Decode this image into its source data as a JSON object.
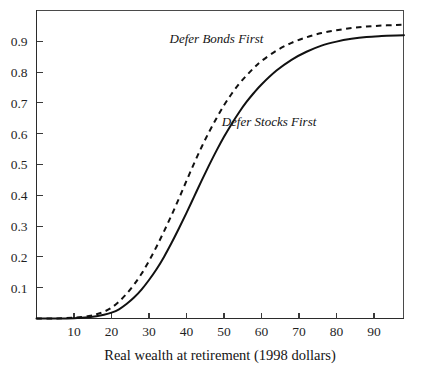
{
  "chart_data": {
    "type": "line",
    "title": "",
    "subtitle": "",
    "xlabel": "Real wealth at retirement (1998 dollars)",
    "ylabel": "",
    "xlim": [
      0,
      98
    ],
    "ylim": [
      0,
      1.0
    ],
    "grid": false,
    "legend_position": "inline-annotations",
    "xticks": [
      10,
      20,
      30,
      40,
      50,
      60,
      70,
      80,
      90
    ],
    "xticklabels": [
      "10",
      "20",
      "30",
      "40",
      "50",
      "60",
      "70",
      "80",
      "90"
    ],
    "yticks": [
      0.1,
      0.2,
      0.3,
      0.4,
      0.5,
      0.6,
      0.7,
      0.8,
      0.9
    ],
    "yticklabels": [
      "0.9",
      "0.8",
      "0.7",
      "0.6",
      "0.5",
      "0.4",
      "0.3",
      "0.2",
      "0.1"
    ],
    "x": [
      0,
      5,
      10,
      14,
      16,
      18,
      20,
      22,
      24,
      26,
      28,
      30,
      32,
      34,
      36,
      38,
      40,
      42,
      44,
      46,
      48,
      50,
      52,
      54,
      56,
      58,
      60,
      64,
      68,
      72,
      76,
      80,
      84,
      88,
      92,
      96,
      98
    ],
    "series": [
      {
        "name": "Defer Bonds First",
        "style": "dashed",
        "color": "#111111",
        "values": [
          0.0,
          0.0,
          0.003,
          0.008,
          0.014,
          0.022,
          0.035,
          0.055,
          0.08,
          0.11,
          0.145,
          0.187,
          0.233,
          0.283,
          0.335,
          0.39,
          0.447,
          0.503,
          0.556,
          0.605,
          0.65,
          0.692,
          0.729,
          0.761,
          0.789,
          0.814,
          0.836,
          0.87,
          0.895,
          0.913,
          0.927,
          0.936,
          0.943,
          0.948,
          0.951,
          0.953,
          0.954
        ]
      },
      {
        "name": "Defer Stocks First",
        "style": "solid",
        "color": "#111111",
        "values": [
          0.0,
          0.0,
          0.001,
          0.004,
          0.007,
          0.012,
          0.019,
          0.03,
          0.047,
          0.068,
          0.094,
          0.125,
          0.16,
          0.2,
          0.245,
          0.293,
          0.343,
          0.395,
          0.447,
          0.497,
          0.545,
          0.59,
          0.631,
          0.669,
          0.703,
          0.733,
          0.76,
          0.805,
          0.84,
          0.866,
          0.886,
          0.899,
          0.908,
          0.914,
          0.917,
          0.919,
          0.92
        ]
      }
    ],
    "annotations": [
      {
        "text": "Defer Bonds First",
        "x_data": 48,
        "y_data": 0.895,
        "style": "italic"
      },
      {
        "text": "Defer Stocks First",
        "x_data": 62,
        "y_data": 0.625,
        "style": "italic"
      }
    ]
  }
}
